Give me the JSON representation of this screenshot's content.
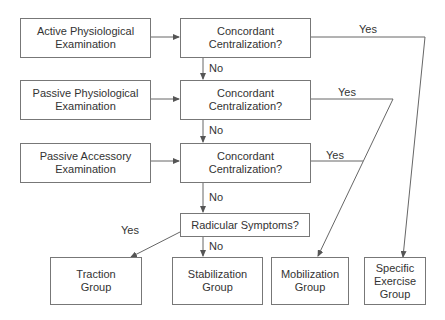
{
  "diagram": {
    "left_boxes": [
      {
        "line1": "Active Physiological",
        "line2": "Examination"
      },
      {
        "line1": "Passive Physiological",
        "line2": "Examination"
      },
      {
        "line1": "Passive Accessory",
        "line2": "Examination"
      }
    ],
    "question_boxes": [
      {
        "line1": "Concordant",
        "line2": "Centralization?"
      },
      {
        "line1": "Concordant",
        "line2": "Centralization?"
      },
      {
        "line1": "Concordant",
        "line2": "Centralization?"
      }
    ],
    "radicular_box": "Radicular Symptoms?",
    "outcome_boxes": [
      {
        "line1": "Traction",
        "line2": "Group"
      },
      {
        "line1": "Stabilization",
        "line2": "Group"
      },
      {
        "line1": "Mobilization",
        "line2": "Group"
      },
      {
        "line1": "Specific",
        "line2": "Exercise",
        "line3": "Group"
      }
    ],
    "edge_labels": {
      "yes": "Yes",
      "no": "No"
    }
  }
}
